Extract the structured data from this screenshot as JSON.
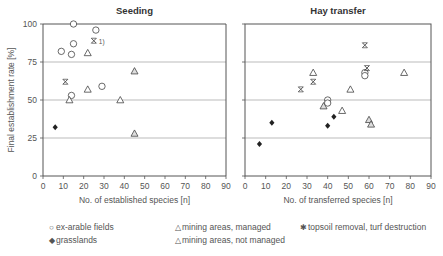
{
  "chart_data": [
    {
      "type": "scatter",
      "title": "Seeding",
      "xlabel": "No. of established species [n]",
      "ylabel": "Final establishment rate [%]",
      "xlim": [
        0,
        90
      ],
      "ylim": [
        0,
        100
      ],
      "xticks": [
        0,
        10,
        20,
        30,
        40,
        50,
        60,
        70,
        80,
        90
      ],
      "yticks": [
        0,
        25,
        50,
        75,
        100
      ],
      "grid": "horizontal at 25, 50, 75",
      "series": [
        {
          "name": "ex-arable fields",
          "marker": "circle-open",
          "points": [
            [
              15,
              100
            ],
            [
              26,
              96
            ],
            [
              15,
              87
            ],
            [
              9,
              82
            ],
            [
              14,
              80
            ],
            [
              29,
              59
            ],
            [
              14,
              53
            ]
          ]
        },
        {
          "name": "mining areas, managed",
          "marker": "triangle-open",
          "points": [
            [
              22,
              81
            ],
            [
              22,
              57
            ],
            [
              13,
              50
            ],
            [
              38,
              50
            ]
          ]
        },
        {
          "name": "mining areas, not managed",
          "marker": "triangle-hatched",
          "points": [
            [
              45,
              69
            ],
            [
              45,
              28
            ]
          ]
        },
        {
          "name": "topsoil removal, turf destruction",
          "marker": "x-star",
          "points": [
            [
              25,
              89
            ],
            [
              11,
              62
            ]
          ]
        },
        {
          "name": "grasslands",
          "marker": "diamond-filled",
          "points": [
            [
              6,
              32
            ]
          ]
        }
      ],
      "annotations": [
        {
          "text": "1)",
          "x": 25,
          "y": 89
        }
      ]
    },
    {
      "type": "scatter",
      "title": "Hay transfer",
      "xlabel": "No. of transferred species [n]",
      "ylabel": "",
      "xlim": [
        0,
        90
      ],
      "ylim": [
        0,
        100
      ],
      "xticks": [
        0,
        10,
        20,
        30,
        40,
        50,
        60,
        70,
        80,
        90
      ],
      "yticks": [
        0,
        25,
        50,
        75,
        100
      ],
      "grid": "horizontal at 25, 50, 75",
      "series": [
        {
          "name": "ex-arable fields",
          "marker": "circle-open",
          "points": [
            [
              58,
              68
            ],
            [
              58,
              66
            ],
            [
              40,
              50
            ],
            [
              40,
              48
            ]
          ]
        },
        {
          "name": "mining areas, managed",
          "marker": "triangle-open",
          "points": [
            [
              33,
              68
            ],
            [
              77,
              68
            ],
            [
              51,
              57
            ],
            [
              47,
              43
            ]
          ]
        },
        {
          "name": "mining areas, not managed",
          "marker": "triangle-hatched",
          "points": [
            [
              38,
              46
            ],
            [
              60,
              37
            ],
            [
              61,
              34
            ]
          ]
        },
        {
          "name": "topsoil removal, turf destruction",
          "marker": "x-star",
          "points": [
            [
              58,
              86
            ],
            [
              59,
              71
            ],
            [
              33,
              62
            ],
            [
              27,
              57
            ]
          ]
        },
        {
          "name": "grasslands",
          "marker": "diamond-filled",
          "points": [
            [
              13,
              35
            ],
            [
              43,
              39
            ],
            [
              40,
              33
            ],
            [
              7,
              21
            ]
          ]
        }
      ]
    }
  ],
  "legend": [
    {
      "symbol": "○",
      "label": "ex-arable fields"
    },
    {
      "symbol": "◆",
      "label": "grasslands"
    },
    {
      "symbol": "△",
      "label": "mining areas, managed"
    },
    {
      "symbol": "△",
      "label": "mining areas, not managed"
    },
    {
      "symbol": "✱",
      "label": "topsoil removal, turf destruction"
    }
  ],
  "colors": {
    "axis": "#555555",
    "grid": "#aaaaaa",
    "marker": "#444444",
    "text": "#555555"
  }
}
